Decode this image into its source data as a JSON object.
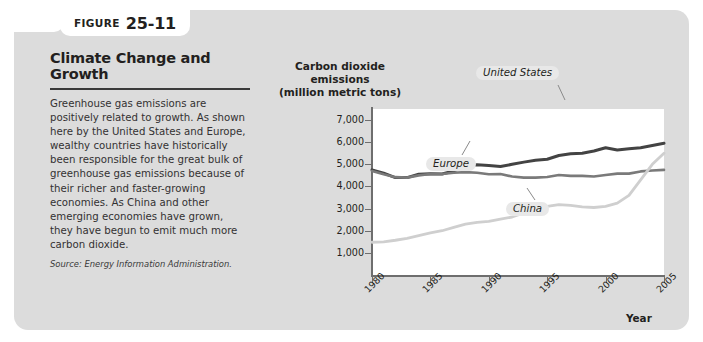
{
  "figure": {
    "tab_word": "Figure",
    "tab_number": "25-11",
    "title": "Climate Change and Growth",
    "body": "Greenhouse gas emissions are positively related to growth. As shown here by the United States and Europe, wealthy countries have historically been responsible for the great bulk of greenhouse gas emissions because of their richer and faster-growing economies. As China and other emerging economies have grown, they have begun to emit much more carbon dioxide.",
    "source": "Source: Energy Information Administration."
  },
  "colors": {
    "panel_background": "#dcdcdc",
    "plot_background": "#ffffff",
    "axis": "#6e6e6e",
    "united_states_line": "#434343",
    "europe_line": "#7a7a7a",
    "china_line": "#cfcfcf",
    "label_pill": "#e8e8e8",
    "text": "#231f20"
  },
  "chart_data": {
    "type": "line",
    "title": "",
    "xlabel": "Year",
    "ylabel": "Carbon dioxide emissions (million metric tons)",
    "ylabel_lines": [
      "Carbon dioxide",
      "emissions",
      "(million metric tons)"
    ],
    "grid": false,
    "legend_position": "inline-annotations",
    "xlim": [
      1980,
      2005
    ],
    "ylim": [
      0,
      7500
    ],
    "xticks": [
      1980,
      1985,
      1990,
      1995,
      2000,
      2005
    ],
    "xtick_labels": [
      "1980",
      "1985",
      "1990",
      "1995",
      "2000",
      "2005"
    ],
    "yticks": [
      1000,
      2000,
      3000,
      4000,
      5000,
      6000,
      7000
    ],
    "ytick_labels": [
      "1,000",
      "2,000",
      "3,000",
      "4,000",
      "5,000",
      "6,000",
      "7,000"
    ],
    "x": [
      1980,
      1981,
      1982,
      1983,
      1984,
      1985,
      1986,
      1987,
      1988,
      1989,
      1990,
      1991,
      1992,
      1993,
      1994,
      1995,
      1996,
      1997,
      1998,
      1999,
      2000,
      2001,
      2002,
      2003,
      2004,
      2005
    ],
    "series": [
      {
        "name": "United States",
        "color": "#434343",
        "values": [
          4750,
          4600,
          4400,
          4400,
          4550,
          4580,
          4560,
          4700,
          4900,
          4980,
          4950,
          4900,
          5000,
          5100,
          5180,
          5230,
          5400,
          5480,
          5500,
          5600,
          5750,
          5650,
          5700,
          5750,
          5850,
          5950
        ]
      },
      {
        "name": "Europe",
        "color": "#7a7a7a",
        "values": [
          4700,
          4550,
          4420,
          4400,
          4500,
          4560,
          4560,
          4620,
          4650,
          4620,
          4550,
          4560,
          4450,
          4400,
          4400,
          4430,
          4520,
          4480,
          4480,
          4450,
          4520,
          4580,
          4580,
          4680,
          4720,
          4750
        ]
      },
      {
        "name": "China",
        "color": "#cfcfcf",
        "values": [
          1480,
          1500,
          1570,
          1660,
          1780,
          1900,
          2000,
          2150,
          2300,
          2380,
          2420,
          2520,
          2620,
          2800,
          2950,
          3100,
          3180,
          3150,
          3080,
          3050,
          3100,
          3250,
          3600,
          4300,
          5000,
          5500
        ]
      }
    ],
    "annotations": [
      {
        "text": "United States",
        "series": "United States"
      },
      {
        "text": "Europe",
        "series": "Europe"
      },
      {
        "text": "China",
        "series": "China"
      }
    ]
  }
}
